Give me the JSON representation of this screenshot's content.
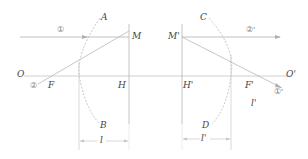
{
  "diagram": {
    "type": "optics-principal-planes",
    "colors": {
      "line": "#b0b0b0",
      "dashed_arc": "#bdbdbd",
      "text": "#444444"
    },
    "labels": {
      "A": "A",
      "B": "B",
      "C": "C",
      "D": "D",
      "M": "M",
      "M_prime": "M'",
      "H": "H",
      "H_prime": "H'",
      "O": "O",
      "O_prime": "O'",
      "F": "F",
      "F_prime": "F'",
      "l": "l",
      "l_prime": "l'",
      "l_prime_side": "l'",
      "ray1": "①",
      "ray2": "②",
      "ray1_prime": "①'",
      "ray2_prime": "②'"
    }
  }
}
